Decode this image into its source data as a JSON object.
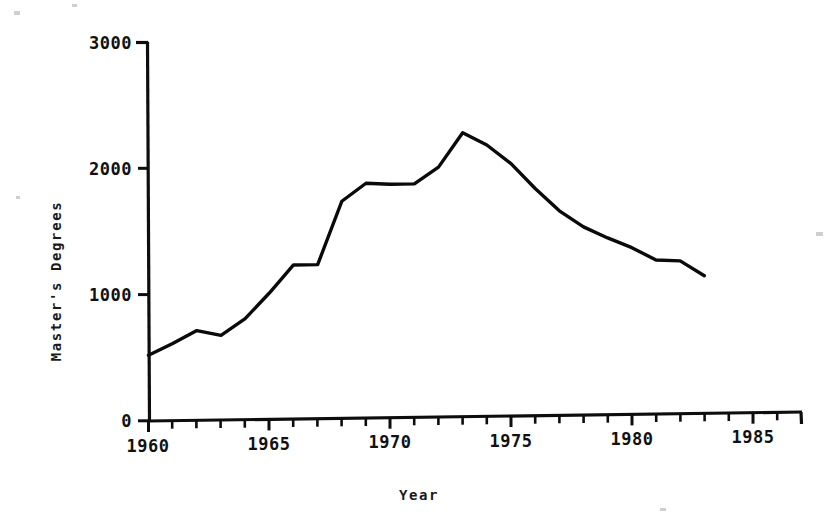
{
  "chart_data": {
    "type": "line",
    "title": "",
    "xlabel": "Year",
    "ylabel": "Master's Degrees",
    "xlim": [
      1960,
      1987
    ],
    "ylim": [
      0,
      3000
    ],
    "grid": false,
    "legend": false,
    "x_tick_labels": [
      "1960",
      "1965",
      "1970",
      "1975",
      "1980",
      "1985"
    ],
    "x_tick_values": [
      1960,
      1965,
      1970,
      1975,
      1980,
      1985
    ],
    "x_minor_tick_interval": 1,
    "y_tick_labels": [
      "0",
      "1000",
      "2000",
      "3000"
    ],
    "y_tick_values": [
      0,
      1000,
      2000,
      3000
    ],
    "series": [
      {
        "name": "Master's Degrees",
        "x": [
          1960,
          1961,
          1962,
          1963,
          1964,
          1965,
          1966,
          1967,
          1968,
          1969,
          1970,
          1971,
          1972,
          1973,
          1974,
          1975,
          1976,
          1977,
          1978,
          1979,
          1980,
          1981,
          1982,
          1983
        ],
        "values": [
          520,
          610,
          710,
          670,
          800,
          1000,
          1220,
          1220,
          1720,
          1860,
          1850,
          1850,
          1980,
          2250,
          2150,
          2000,
          1800,
          1620,
          1490,
          1400,
          1320,
          1220,
          1210,
          1090
        ]
      }
    ],
    "line_color": "#0a0a0a",
    "background_color": "#ffffff",
    "axis_color": "#0d0d0d"
  },
  "figure": {
    "x_axis_title": "Year",
    "y_axis_title": "Master's Degrees"
  }
}
